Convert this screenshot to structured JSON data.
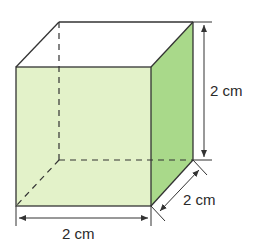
{
  "figure": {
    "type": "cube",
    "colors": {
      "front_face": "#e3f2c9",
      "side_face": "#a9d98a",
      "edge": "#333333"
    },
    "labels": {
      "height": "2 cm",
      "depth": "2 cm",
      "width": "2 cm"
    }
  }
}
